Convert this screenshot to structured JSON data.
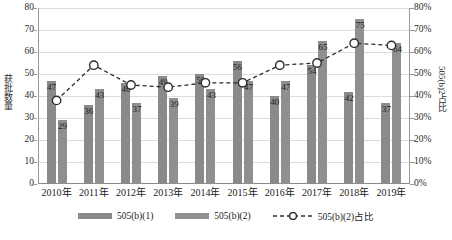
{
  "chart_data": {
    "type": "bar",
    "title": "",
    "xlabel": "",
    "ylabel": "获批数量",
    "y2label": "505(b)2占比",
    "categories": [
      "2010年",
      "2011年",
      "2012年",
      "2013年",
      "2014年",
      "2015年",
      "2016年",
      "2017年",
      "2018年",
      "2019年"
    ],
    "ylim": [
      0,
      80
    ],
    "y2lim": [
      0,
      0.8
    ],
    "yticks": [
      "0",
      "10",
      "20",
      "30",
      "40",
      "50",
      "60",
      "70",
      "80"
    ],
    "y2ticks": [
      "0%",
      "10%",
      "20%",
      "30%",
      "40%",
      "50%",
      "60%",
      "70%",
      "80%"
    ],
    "grid": true,
    "legend_position": "bottom",
    "series": [
      {
        "name": "505(b)(1)",
        "type": "bar",
        "axis": "left",
        "color": "#8a8a8a",
        "values": [
          47,
          36,
          46,
          49,
          50,
          56,
          40,
          54,
          42,
          37
        ]
      },
      {
        "name": "505(b)(2)",
        "type": "bar",
        "axis": "left",
        "color": "#8f8f8f",
        "values": [
          29,
          43,
          37,
          39,
          43,
          47,
          47,
          65,
          75,
          64
        ]
      },
      {
        "name": "505(b)(2)占比",
        "type": "line",
        "axis": "right",
        "color": "#2c2c2c",
        "marker": "open-circle",
        "dashed": true,
        "values": [
          0.38,
          0.54,
          0.45,
          0.44,
          0.46,
          0.46,
          0.54,
          0.55,
          0.64,
          0.63
        ]
      }
    ]
  },
  "legend": {
    "items": [
      {
        "label": "505(b)(1)",
        "icon": "bar-swatch-icon"
      },
      {
        "label": "505(b)(2)",
        "icon": "bar-swatch-icon"
      },
      {
        "label": "505(b)(2)占比",
        "icon": "dashed-line-marker-icon"
      }
    ]
  }
}
